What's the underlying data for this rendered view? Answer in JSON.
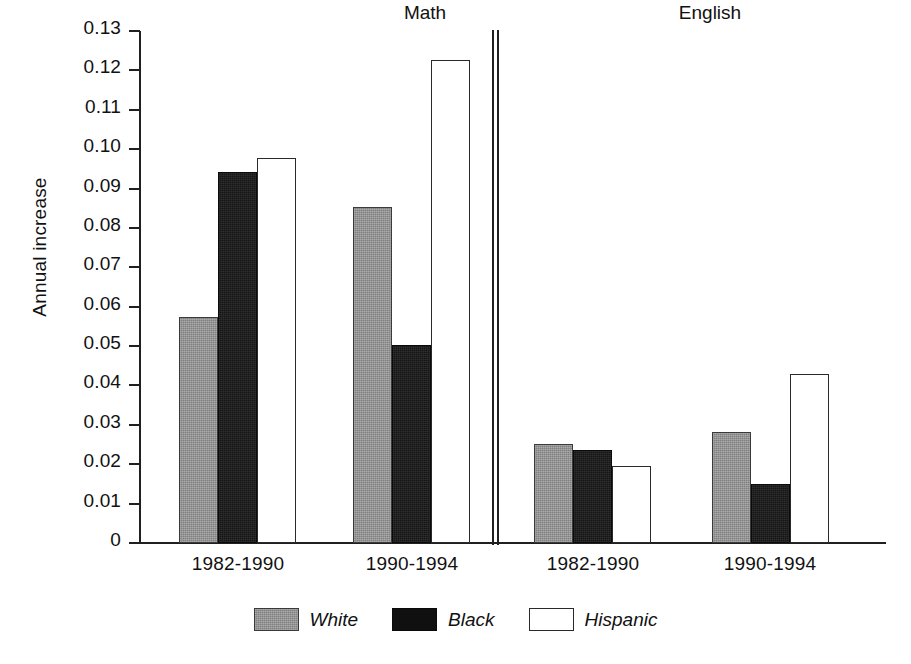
{
  "chart_data": {
    "type": "bar",
    "title": "",
    "xlabel": "",
    "ylabel": "Annual increase",
    "ylim": [
      0,
      0.13
    ],
    "grid": false,
    "legend_position": "bottom-center",
    "panels": [
      {
        "name": "Math",
        "categories": [
          "1982-1990",
          "1990-1994"
        ],
        "series": [
          {
            "name": "White",
            "values": [
              0.0573,
              0.0852
            ]
          },
          {
            "name": "Black",
            "values": [
              0.0943,
              0.0504
            ]
          },
          {
            "name": "Hispanic",
            "values": [
              0.0977,
              0.1226
            ]
          }
        ]
      },
      {
        "name": "English",
        "categories": [
          "1982-1990",
          "1990-1994"
        ],
        "series": [
          {
            "name": "White",
            "values": [
              0.0252,
              0.0281
            ]
          },
          {
            "name": "Black",
            "values": [
              0.0237,
              0.015
            ]
          },
          {
            "name": "Hispanic",
            "values": [
              0.0196,
              0.0429
            ]
          }
        ]
      }
    ],
    "yticks": [
      {
        "value": 0.13,
        "label": "0.13"
      },
      {
        "value": 0.12,
        "label": "0.12"
      },
      {
        "value": 0.11,
        "label": "0.11"
      },
      {
        "value": 0.1,
        "label": "0.10"
      },
      {
        "value": 0.09,
        "label": "0.09"
      },
      {
        "value": 0.08,
        "label": "0.08"
      },
      {
        "value": 0.07,
        "label": "0.07"
      },
      {
        "value": 0.06,
        "label": "0.06"
      },
      {
        "value": 0.05,
        "label": "0.05"
      },
      {
        "value": 0.04,
        "label": "0.04"
      },
      {
        "value": 0.03,
        "label": "0.03"
      },
      {
        "value": 0.02,
        "label": "0.02"
      },
      {
        "value": 0.01,
        "label": "0.01"
      },
      {
        "value": 0.0,
        "label": "0"
      }
    ],
    "legend": [
      {
        "name": "White",
        "swatch": "gray-hatched-swatch",
        "color": "#808080"
      },
      {
        "name": "Black",
        "swatch": "black-swatch",
        "color": "#101010"
      },
      {
        "name": "Hispanic",
        "swatch": "white-outline-swatch",
        "color": "#ffffff"
      }
    ]
  },
  "axis": {
    "ylabel": "Annual increase"
  },
  "panel_titles": {
    "math": "Math",
    "english": "English"
  },
  "group_labels": {
    "math_1": "1982-1990",
    "math_2": "1990-1994",
    "english_1": "1982-1990",
    "english_2": "1990-1994"
  },
  "legend_labels": {
    "white": "White",
    "black": "Black",
    "hispanic": "Hispanic"
  }
}
